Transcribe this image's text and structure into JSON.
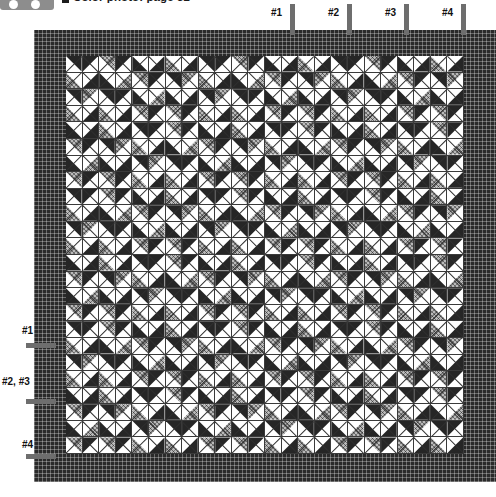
{
  "header": {
    "logo_icon": "publisher-logo-badge",
    "bullet_icon": "square-bullet-icon",
    "caption": "Color photo: page 52"
  },
  "diagram": {
    "name": "quilt-assembly-diagram",
    "type": "quilt-block-layout",
    "grid_columns": 24,
    "grid_rows": 24,
    "border_label": "outer-border",
    "fabrics": [
      {
        "key": "dark",
        "label": "dark fabric",
        "color": "#262626"
      },
      {
        "key": "med",
        "label": "medium print fabric",
        "color": "#b9b9b9"
      },
      {
        "key": "light",
        "label": "light background",
        "color": "#ffffff"
      }
    ]
  },
  "markers": {
    "top": [
      {
        "label": "#1",
        "label_x": 271,
        "label_y": 7,
        "tick_x": 290,
        "tick_y": 4,
        "tick_h": 31
      },
      {
        "label": "#2",
        "label_x": 328,
        "label_y": 7,
        "tick_x": 347,
        "tick_y": 4,
        "tick_h": 31
      },
      {
        "label": "#3",
        "label_x": 385,
        "label_y": 7,
        "tick_x": 404,
        "tick_y": 4,
        "tick_h": 31
      },
      {
        "label": "#4",
        "label_x": 442,
        "label_y": 7,
        "tick_x": 461,
        "tick_y": 4,
        "tick_h": 31
      }
    ],
    "left": [
      {
        "label": "#1",
        "label_x": 22,
        "label_y": 325,
        "tick_x": 26,
        "tick_y": 343,
        "tick_w": 30
      },
      {
        "label": "#2, #3",
        "label_x": 2,
        "label_y": 376,
        "tick_x": 26,
        "tick_y": 399,
        "tick_w": 30
      },
      {
        "label": "#4",
        "label_x": 22,
        "label_y": 439,
        "tick_x": 26,
        "tick_y": 454,
        "tick_w": 30
      }
    ]
  },
  "chart_data": {
    "type": "heatmap",
    "xlabel": "",
    "ylabel": "",
    "categories": [],
    "legend_position": "none",
    "grid": true,
    "note": "24 x 24 grid of half-square triangle units inside a pieced dark outer border; tick markers #1-#4 indicate border/row seam references along the top and left edges."
  }
}
